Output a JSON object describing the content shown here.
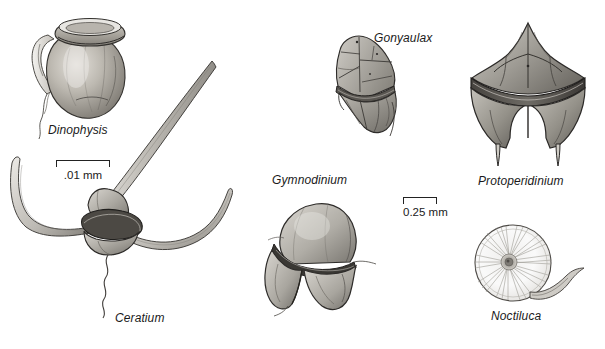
{
  "plate": {
    "background_color": "#ffffff",
    "ink_color": "#1a1a1a",
    "width": 605,
    "height": 349,
    "subject": "dinoflagellates"
  },
  "figures": [
    {
      "id": "dinophysis",
      "caption": "Dinophysis",
      "description": "pot-shaped armored cell with flared girdle lists and a sail-like left sulcal list, trailing flagellum"
    },
    {
      "id": "gonyaulax",
      "caption": "Gonyaulax",
      "description": "angular faceted armored cell with plate sutures and cingulum"
    },
    {
      "id": "protoperidinium",
      "caption": "Protoperidinium",
      "description": "armored cell with apical horn, deep equatorial cingulum and two antapical spines"
    },
    {
      "id": "gymnodinium",
      "caption": "Gymnodinium",
      "description": "unarmored cell with rounded epicone and lobed hypocone divided by a cingulum"
    },
    {
      "id": "ceratium",
      "caption": "Ceratium",
      "description": "cell with one long apical horn and two curved antapical horns, wavy trailing flagellum"
    },
    {
      "id": "noctiluca",
      "caption": "Noctiluca",
      "description": "pale spherical cell with radiating striations and a curved tentacle"
    }
  ],
  "scale_bars": [
    {
      "id": "scale-small",
      "label": ".01 mm"
    },
    {
      "id": "scale-large",
      "label": "0.25 mm"
    }
  ]
}
